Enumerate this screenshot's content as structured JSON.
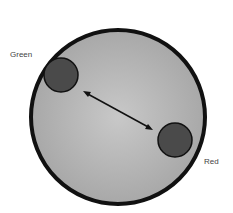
{
  "labels": {
    "green": "Green",
    "red": "Red"
  },
  "colors": {
    "dish_fill": "#b9b9b9",
    "dish_border": "#111111",
    "blob_fill": "#4a4a4a",
    "arrow": "#111111"
  }
}
